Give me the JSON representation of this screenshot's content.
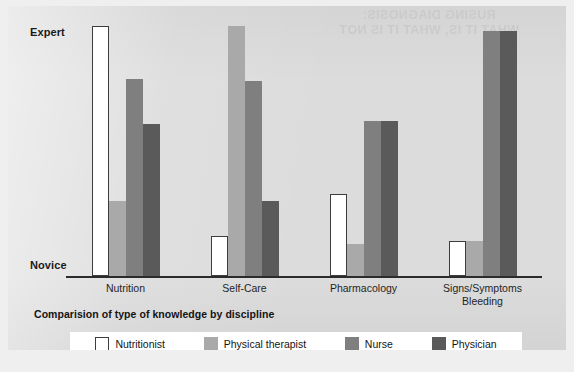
{
  "figure": {
    "caption": "Comparision of type of knowledge by discipline",
    "y_axis_top_label": "Expert",
    "y_axis_bottom_label": "Novice",
    "bleed_through_text": "RUSING DIAGNOSIS:\nWHAT IT IS, WHAT IT IS NOT"
  },
  "legend": {
    "items": [
      {
        "key": "nutritionist",
        "label": "Nutritionist",
        "color": "#ffffff"
      },
      {
        "key": "therapist",
        "label": "Physical therapist",
        "color": "#a9a9a9"
      },
      {
        "key": "nurse",
        "label": "Nurse",
        "color": "#7f7f7f"
      },
      {
        "key": "physician",
        "label": "Physician",
        "color": "#5a5a5a"
      }
    ]
  },
  "chart_data": {
    "type": "bar",
    "title": "Comparision of type of knowledge by discipline",
    "xlabel": "",
    "ylabel": "",
    "ylim": [
      0,
      100
    ],
    "y_tick_labels": [
      "Novice",
      "Expert"
    ],
    "grid": false,
    "legend_position": "bottom",
    "categories": [
      "Nutrition",
      "Self-Care",
      "Pharmacology",
      "Signs/Symptoms\nBleeding"
    ],
    "series": [
      {
        "name": "Nutritionist",
        "color": "#ffffff",
        "values": [
          100,
          16,
          33,
          14
        ]
      },
      {
        "name": "Physical therapist",
        "color": "#a9a9a9",
        "values": [
          30,
          100,
          13,
          14
        ]
      },
      {
        "name": "Nurse",
        "color": "#7f7f7f",
        "values": [
          79,
          78,
          62,
          98
        ]
      },
      {
        "name": "Physician",
        "color": "#5a5a5a",
        "values": [
          61,
          30,
          62,
          98
        ]
      }
    ]
  }
}
